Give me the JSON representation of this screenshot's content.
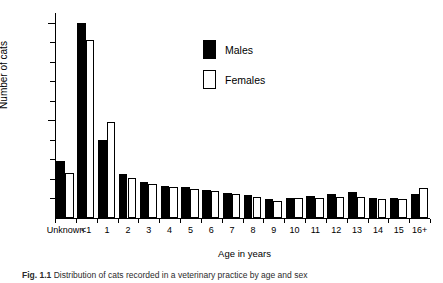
{
  "figure": {
    "caption_label": "Fig. 1.1",
    "caption_text": "Distribution of cats recorded in a veterinary practice by age and sex"
  },
  "legend": {
    "position": "top-center-right",
    "items": [
      {
        "label": "Males",
        "swatch": "filled-black-square",
        "color": "#000000"
      },
      {
        "label": "Females",
        "swatch": "open-white-square",
        "color": "#ffffff"
      }
    ]
  },
  "axes": {
    "y": {
      "title": "Number of cats",
      "major_ticks": [
        500,
        1000
      ],
      "major_tick_labels": [
        "500",
        "1000"
      ],
      "minor_tick_step": 100,
      "range": [
        0,
        1050
      ]
    },
    "x": {
      "title": "Age in years",
      "tick_labels": [
        "Unknown",
        "<1",
        "1",
        "2",
        "3",
        "4",
        "5",
        "6",
        "7",
        "8",
        "9",
        "10",
        "11",
        "12",
        "13",
        "14",
        "15",
        "16+"
      ]
    }
  },
  "chart_data": {
    "type": "bar",
    "title": "",
    "subtitle": "",
    "xlabel": "Age in years",
    "ylabel": "Number of cats",
    "ylim": [
      0,
      1050
    ],
    "grid": false,
    "legend_position": "top-center-right",
    "categories": [
      "Unknown",
      "<1",
      "1",
      "2",
      "3",
      "4",
      "5",
      "6",
      "7",
      "8",
      "9",
      "10",
      "11",
      "12",
      "13",
      "14",
      "15",
      "16+"
    ],
    "series": [
      {
        "name": "Males",
        "color": "#000000",
        "values": [
          290,
          1000,
          400,
          225,
          185,
          165,
          160,
          145,
          130,
          120,
          95,
          105,
          115,
          125,
          135,
          105,
          100,
          125
        ]
      },
      {
        "name": "Females",
        "color": "#ffffff",
        "values": [
          230,
          910,
          490,
          205,
          175,
          160,
          150,
          140,
          125,
          110,
          85,
          100,
          105,
          110,
          110,
          95,
          95,
          155
        ]
      }
    ],
    "annotations": []
  }
}
